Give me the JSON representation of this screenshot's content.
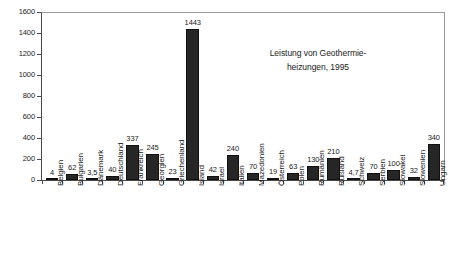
{
  "chart_data": {
    "type": "bar",
    "title": "",
    "annotation_lines": [
      "Leistung von Geothermie-",
      "heizungen, 1995"
    ],
    "annotation_text": "Leistung von Geothermieheizungen, 1995",
    "xlabel": "",
    "ylabel": "",
    "ylim": [
      0,
      1600
    ],
    "ytick_step": 200,
    "yticks": [
      1600,
      1400,
      1200,
      1000,
      800,
      600,
      400,
      200,
      0
    ],
    "ytick_labels": [
      "1600",
      "1400",
      "1200",
      "1000",
      "800",
      "600",
      "400",
      "200",
      "0"
    ],
    "grid": false,
    "legend": false,
    "bar_color": "#262626",
    "categories": [
      "Belgien",
      "Bulgarien",
      "Dänemark",
      "Deutschland",
      "Frankreich",
      "Georgien",
      "Griechenland",
      "Island",
      "Israel",
      "Italien",
      "Mazedonien",
      "Österreich",
      "Polen",
      "Rumänien",
      "Rußland",
      "Schweiz",
      "Serbien",
      "Slowakei",
      "Slowenien",
      "Ungarn"
    ],
    "values": [
      4,
      62,
      3.5,
      40,
      337,
      245,
      23,
      1443,
      42,
      240,
      70,
      19,
      63,
      130,
      210,
      4.7,
      70,
      100,
      32,
      340
    ],
    "value_labels": [
      "4",
      "62",
      "3,5",
      "40",
      "337",
      "245",
      "23",
      "1443",
      "42",
      "240",
      "70",
      "19",
      "63",
      "130",
      "210",
      "4,7",
      "70",
      "100",
      "32",
      "340"
    ]
  }
}
